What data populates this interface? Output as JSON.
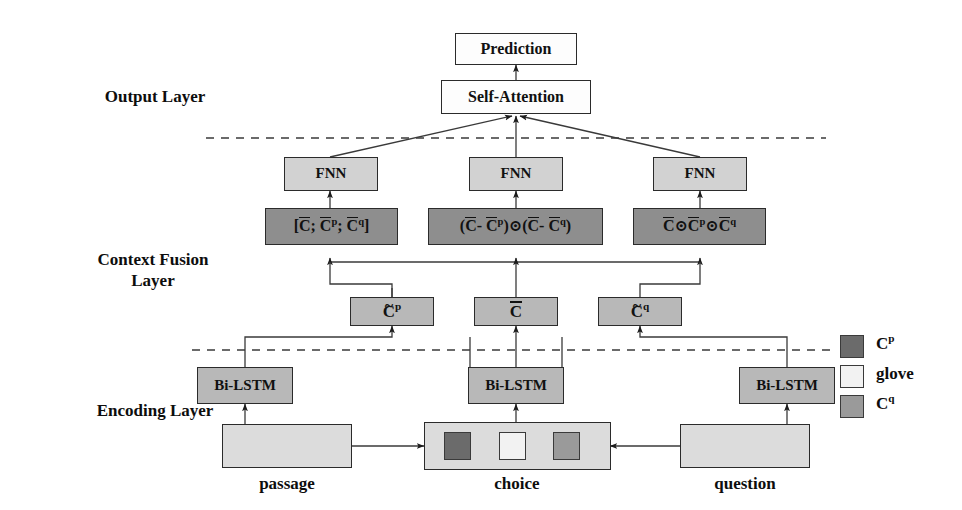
{
  "figure": {
    "background": "#ffffff"
  },
  "layer_labels": [
    {
      "id": "output",
      "text": "Output Layer"
    },
    {
      "id": "context_fusion_line1",
      "text": "Context Fusion"
    },
    {
      "id": "context_fusion_line2",
      "text": "Layer"
    },
    {
      "id": "encoding",
      "text": "Encoding Layer"
    }
  ],
  "nodes": {
    "prediction": {
      "label": "Prediction",
      "fill": "#fdfdfd"
    },
    "self_attention": {
      "label": "Self-Attention",
      "fill": "#fdfdfd"
    },
    "fnn_left": {
      "label": "FNN",
      "fill": "#d2d2d2"
    },
    "fnn_mid": {
      "label": "FNN",
      "fill": "#d2d2d2"
    },
    "fnn_right": {
      "label": "FNN",
      "fill": "#d2d2d2"
    },
    "fusion_concat": {
      "label": "[C; C^p; C^q]",
      "fill": "#8e8e8e"
    },
    "fusion_diff": {
      "label": "(C- C^p) ⊙ (C- C^q)",
      "fill": "#8e8e8e"
    },
    "fusion_prod": {
      "label": "C ⊙ C^p ⊙ C^q",
      "fill": "#8e8e8e"
    },
    "c_tilde_p": {
      "label": "C^p",
      "fill": "#b8b8b8"
    },
    "c_bar": {
      "label": "C",
      "fill": "#b8b8b8"
    },
    "c_tilde_q": {
      "label": "C^q",
      "fill": "#b8b8b8"
    },
    "bilstm_left": {
      "label": "Bi-LSTM",
      "fill": "#b8b8b8"
    },
    "bilstm_mid": {
      "label": "Bi-LSTM",
      "fill": "#b8b8b8"
    },
    "bilstm_right": {
      "label": "Bi-LSTM",
      "fill": "#b8b8b8"
    },
    "passage_box": {
      "label": "",
      "fill": "#dcdcdc"
    },
    "choice_box": {
      "label": "",
      "fill": "#dcdcdc"
    },
    "question_box": {
      "label": "",
      "fill": "#dcdcdc"
    }
  },
  "choice_tokens": [
    {
      "name": "cp-token",
      "fill": "#6b6b6b"
    },
    {
      "name": "glove-token",
      "fill": "#f2f2f2"
    },
    {
      "name": "cq-token",
      "fill": "#9a9a9a"
    }
  ],
  "io_labels": {
    "passage": "passage",
    "choice": "choice",
    "question": "question"
  },
  "legend": {
    "items": [
      {
        "label": "C",
        "sup": "p",
        "fill": "#6b6b6b"
      },
      {
        "label": "glove",
        "sup": "",
        "fill": "#f2f2f2"
      },
      {
        "label": "C",
        "sup": "q",
        "fill": "#9a9a9a"
      }
    ]
  },
  "dividers": [
    {
      "name": "output-context-divider",
      "y": 138
    },
    {
      "name": "context-encoding-divider",
      "y": 350
    }
  ],
  "colors": {
    "stroke": "#2b2b2b",
    "text": "#0d0d0d",
    "light_gray": "#d2d2d2",
    "mid_gray": "#b8b8b8",
    "dark_gray": "#8e8e8e",
    "pale_gray": "#dcdcdc"
  }
}
